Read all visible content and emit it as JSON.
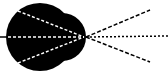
{
  "diagram": {
    "type": "optics-focus",
    "colors": {
      "background": "#ffffff",
      "body": "#000000",
      "inner_rays": "#ffffff",
      "outer_rays": "#000000"
    },
    "body_shape": {
      "circle_center": [
        40,
        37
      ],
      "circle_radius": 34,
      "bulge_center": [
        62,
        37
      ],
      "bulge_radius": 24
    },
    "incoming_line": {
      "from": [
        0,
        37
      ],
      "to": [
        8,
        37
      ]
    },
    "focal_point": [
      84,
      37
    ],
    "inner_rays": [
      {
        "from": [
          18,
          11
        ],
        "to": [
          84,
          37
        ]
      },
      {
        "from": [
          8,
          37
        ],
        "to": [
          84,
          37
        ]
      },
      {
        "from": [
          18,
          63
        ],
        "to": [
          84,
          37
        ]
      }
    ],
    "outer_rays": [
      {
        "from": [
          86,
          37
        ],
        "to": [
          150,
          10
        ],
        "style": "dashed"
      },
      {
        "from": [
          86,
          37
        ],
        "to": [
          168,
          36
        ],
        "style": "dotted"
      },
      {
        "from": [
          86,
          37
        ],
        "to": [
          150,
          62
        ],
        "style": "dashed"
      }
    ]
  }
}
